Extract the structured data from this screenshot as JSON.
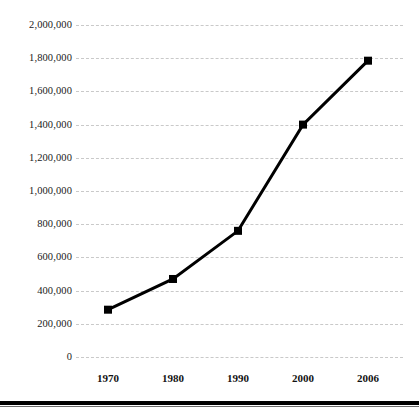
{
  "chart_data": {
    "type": "line",
    "title": "",
    "subtitle": "",
    "xlabel": "",
    "ylabel": "",
    "categories": [
      "1970",
      "1980",
      "1990",
      "2000",
      "2006"
    ],
    "values": [
      285000,
      470000,
      760000,
      1400000,
      1785000
    ],
    "series": [
      {
        "name": "",
        "values": [
          285000,
          470000,
          760000,
          1400000,
          1785000
        ]
      }
    ],
    "ylim": [
      0,
      2000000
    ],
    "ytick_values": [
      0,
      200000,
      400000,
      600000,
      800000,
      1000000,
      1200000,
      1400000,
      1600000,
      1800000,
      2000000
    ],
    "ytick_labels": [
      "0",
      "200,000",
      "400,000",
      "600,000",
      "800,000",
      "1,000,000",
      "1,200,000",
      "1,400,000",
      "1,600,000",
      "1,800,000",
      "2,000,000"
    ],
    "xtick_labels": [
      "1970",
      "1980",
      "1990",
      "2000",
      "2006"
    ],
    "grid": true,
    "grid_axis": "y",
    "grid_style": "dashed",
    "legend": false,
    "legend_position": "none",
    "annotations": [],
    "colors": {
      "line": "#000000",
      "marker": "#000000",
      "grid": "#c9c9c9",
      "background": "#ffffff",
      "text": "#1a1a1a",
      "rule": "#000000"
    },
    "marker_shape": "square",
    "line_width": 3
  }
}
